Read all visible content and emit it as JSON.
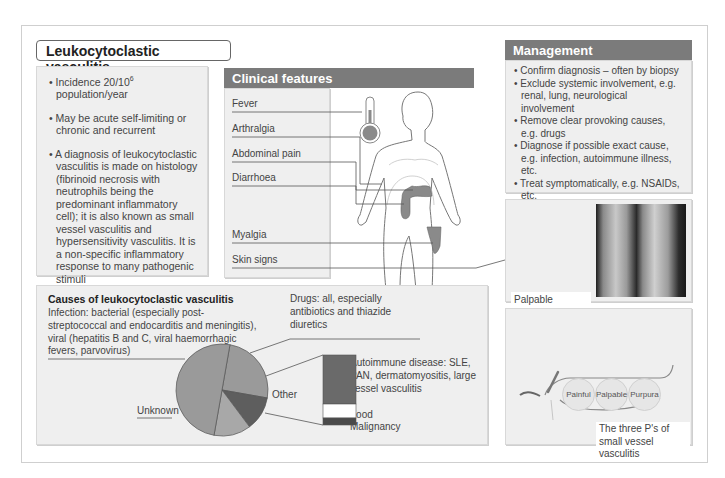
{
  "title": "Leukocytoclastic vasculitis",
  "overview": {
    "bullets": [
      {
        "pre": "Incidence 20/10",
        "sup": "6",
        "post": " population/year"
      },
      {
        "text": "May be acute self-limiting or chronic and recurrent"
      },
      {
        "text": "A diagnosis of leukocytoclastic vasculitis is made on histology (fibrinoid necrosis with neutrophils being the predominant inflammatory cell); it is also known as small vessel vasculitis and hypersensitivity vasculitis. It is a non-specific inflammatory response to many pathogenic stimuli"
      }
    ]
  },
  "clinical_features": {
    "header": "Clinical features",
    "items": [
      "Fever",
      "Arthralgia",
      "Abdominal pain",
      "Diarrhoea",
      "Myalgia",
      "Skin signs"
    ]
  },
  "management": {
    "header": "Management",
    "bullets": [
      "Confirm diagnosis – often by biopsy",
      "Exclude systemic involvement, e.g. renal, lung, neurological involvement",
      "Remove clear provoking causes, e.g. drugs",
      "Diagnose if possible exact cause, e.g. infection, autoimmune illness, etc.",
      "Treat symptomatically, e.g. NSAIDs, etc."
    ]
  },
  "photo": {
    "caption": "Palpable purpuric lesions on both legs indicate small vessel vasculitis"
  },
  "three_ps": {
    "peas": [
      "Painful",
      "Palpable",
      "Purpura"
    ],
    "caption": "The three P's of small vessel vasculitis"
  },
  "causes": {
    "title": "Causes of leukocytoclastic vasculitis",
    "infection": "Infection: bacterial (especially post-streptococcal and endocarditis and meningitis), viral (hepatitis B and C, viral haemorrhagic fevers, parvovirus)",
    "drugs": "Drugs: all, especially antibiotics and thiazide diuretics",
    "other_label": "Other",
    "unknown_label": "Unknown",
    "autoimmune": "Autoimmune disease: SLE, PAN, dermatomyositis, large vessel vasculitis",
    "food": "Food",
    "malignancy": "Malignancy"
  },
  "colors": {
    "header_bg": "#7b7b7b",
    "panel_bg": "#efefef",
    "pie_main": "#9a9a9a",
    "pie_drugs": "#5e5e5e",
    "pie_other": "#a8a8a8",
    "bar_autoimmune": "#6a6a6a",
    "bar_food": "#ffffff",
    "bar_malignancy": "#4a4a4a",
    "organ": "#8a8a8a"
  },
  "chart_data": {
    "type": "pie",
    "title": "Causes of leukocytoclastic vasculitis",
    "slices": [
      {
        "label": "Infection",
        "value": 25
      },
      {
        "label": "Drugs",
        "value": 12
      },
      {
        "label": "Other",
        "value": 13
      },
      {
        "label": "Unknown",
        "value": 50
      }
    ],
    "other_breakdown": [
      {
        "label": "Autoimmune disease",
        "value": 70
      },
      {
        "label": "Food",
        "value": 20
      },
      {
        "label": "Malignancy",
        "value": 10
      }
    ]
  }
}
